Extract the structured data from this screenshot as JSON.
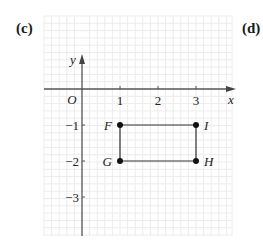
{
  "labels": {
    "left_part": "(c)",
    "right_part": "(d)"
  },
  "axes": {
    "x_label": "x",
    "y_label": "y",
    "origin_label": "O"
  },
  "x_ticks": [
    "1",
    "2",
    "3"
  ],
  "y_ticks": [
    "−1",
    "−2",
    "−3"
  ],
  "points": [
    {
      "name": "F",
      "x": 1,
      "y": -1
    },
    {
      "name": "I",
      "x": 3,
      "y": -1
    },
    {
      "name": "H",
      "x": 3,
      "y": -2
    },
    {
      "name": "G",
      "x": 1,
      "y": -2
    }
  ],
  "colors": {
    "grid": "#ececec",
    "axis": "#555555",
    "shape": "#333333",
    "point": "#111111"
  }
}
